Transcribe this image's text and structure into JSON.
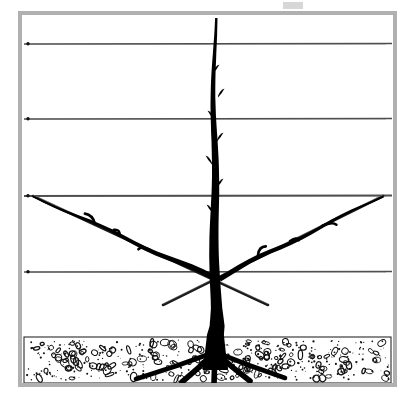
{
  "figure": {
    "title": "Trellis-trained fruit tree with central leader and two diagonal scaffold branches",
    "kind": "line-drawing",
    "style": "black-and-white horticultural illustration",
    "canvas": {
      "width": 415,
      "height": 399,
      "background": "#ffffff"
    },
    "top_artifact": {
      "present": true,
      "label": "faint-page-mark",
      "x": 283,
      "y": 2,
      "width": 20,
      "height": 7,
      "color": "#c9c9c9"
    }
  },
  "frame": {
    "name": "picture-border",
    "x": 20,
    "y": 13,
    "width": 375,
    "height": 372,
    "stroke": "#b0b0b0",
    "stroke_width": 4
  },
  "wires": {
    "name": "trellis-wires",
    "count": 4,
    "color": "#3a3a3a",
    "x_start": 24,
    "x_end": 392,
    "items": [
      {
        "label": "wire-1-top",
        "y": 44,
        "thickness": 1.6
      },
      {
        "label": "wire-2",
        "y": 119,
        "thickness": 1.6
      },
      {
        "label": "wire-3",
        "y": 196,
        "thickness": 1.8
      },
      {
        "label": "wire-4-bottom",
        "y": 272,
        "thickness": 1.6
      }
    ]
  },
  "soil": {
    "name": "soil-band",
    "top_y": 337,
    "bottom_y": 383,
    "x_start": 24,
    "x_end": 391,
    "fill": "#ffffff",
    "texture": "stippled-pebble",
    "texture_color": "#111111",
    "pebble_count": 150,
    "dot_count": 340
  },
  "tree": {
    "name": "fruit-tree",
    "color": "#000000",
    "trunk": {
      "label": "central-leader-trunk",
      "base_x": 215,
      "base_y": 370,
      "top_y": 18,
      "base_width": 13,
      "top_width": 2.4
    },
    "buds": [
      {
        "label": "bud-spur-1",
        "x": 213,
        "y": 72,
        "side": "right"
      },
      {
        "label": "bud-spur-2",
        "x": 218,
        "y": 96,
        "side": "right"
      },
      {
        "label": "bud-spur-3",
        "x": 214,
        "y": 118,
        "side": "left"
      },
      {
        "label": "bud-spur-4",
        "x": 217,
        "y": 140,
        "side": "right"
      },
      {
        "label": "bud-spur-5",
        "x": 212,
        "y": 163,
        "side": "left"
      },
      {
        "label": "bud-spur-6",
        "x": 217,
        "y": 186,
        "side": "right"
      },
      {
        "label": "bud-spur-7",
        "x": 213,
        "y": 212,
        "side": "left"
      }
    ],
    "branches": [
      {
        "label": "left-scaffold-branch",
        "from_x": 213,
        "from_y": 278,
        "to_x": 33,
        "to_y": 196,
        "thickness": 5.5,
        "spurs": [
          {
            "x": 120,
            "y": 236
          },
          {
            "x": 150,
            "y": 250
          },
          {
            "x": 95,
            "y": 224
          }
        ]
      },
      {
        "label": "right-scaffold-branch",
        "from_x": 219,
        "from_y": 278,
        "to_x": 383,
        "to_y": 196,
        "thickness": 5.5,
        "spurs": [
          {
            "x": 290,
            "y": 241
          },
          {
            "x": 258,
            "y": 255
          },
          {
            "x": 322,
            "y": 226
          }
        ]
      }
    ],
    "canes": [
      {
        "label": "support-cane-left",
        "from_x": 33,
        "from_y": 196,
        "to_x": 268,
        "to_y": 305,
        "thickness": 2.6
      },
      {
        "label": "support-cane-right",
        "from_x": 383,
        "from_y": 196,
        "to_x": 163,
        "to_y": 305,
        "thickness": 2.6
      }
    ],
    "roots": [
      {
        "label": "root-left-outer",
        "to_x": 136,
        "to_y": 379
      },
      {
        "label": "root-left-inner",
        "to_x": 182,
        "to_y": 382
      },
      {
        "label": "root-center",
        "to_x": 214,
        "to_y": 384
      },
      {
        "label": "root-right-inner",
        "to_x": 250,
        "to_y": 381
      },
      {
        "label": "root-right-outer",
        "to_x": 285,
        "to_y": 378
      }
    ]
  }
}
